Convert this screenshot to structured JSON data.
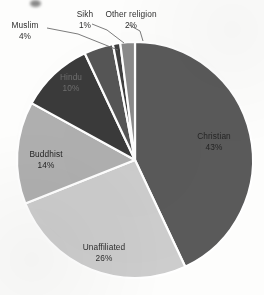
{
  "chart_data": {
    "type": "pie",
    "title": "",
    "categories": [
      "Christian",
      "Unaffiliated",
      "Buddhist",
      "Hindu",
      "Muslim",
      "Sikh",
      "Other religion"
    ],
    "values": [
      43,
      26,
      14,
      10,
      4,
      1,
      2
    ],
    "unit": "%",
    "total": 100,
    "start_angle_deg": 0,
    "direction": "clockwise",
    "legend": "none",
    "labels_position": "mixed-inside-and-outside-with-leader-lines",
    "slices": [
      {
        "label": "Christian",
        "value": 43,
        "value_text": "43%",
        "color": "#5a5a5a",
        "label_placement": "inside",
        "text_color": "#242424"
      },
      {
        "label": "Unaffiliated",
        "value": 26,
        "value_text": "26%",
        "color": "#cdcdcd",
        "label_placement": "outside",
        "text_color": "#2e2e2e"
      },
      {
        "label": "Buddhist",
        "value": 14,
        "value_text": "14%",
        "color": "#b0b0b0",
        "label_placement": "inside",
        "text_color": "#242424"
      },
      {
        "label": "Hindu",
        "value": 10,
        "value_text": "10%",
        "color": "#3a3a3a",
        "label_placement": "inside",
        "text_color": "#6e6e6e"
      },
      {
        "label": "Muslim",
        "value": 4,
        "value_text": "4%",
        "color": "#555555",
        "label_placement": "outside",
        "text_color": "#2e2e2e"
      },
      {
        "label": "Sikh",
        "value": 1,
        "value_text": "1%",
        "color": "#3f3f3f",
        "label_placement": "outside",
        "text_color": "#2e2e2e"
      },
      {
        "label": "Other religion",
        "value": 2,
        "value_text": "2%",
        "color": "#8a8a8a",
        "label_placement": "outside",
        "text_color": "#2e2e2e"
      }
    ],
    "divider_color": "#ffffff",
    "background": "#ffffff"
  },
  "labels": {
    "christian": {
      "name": "Christian",
      "pct": "43%"
    },
    "unaffiliated": {
      "name": "Unaffiliated",
      "pct": "26%"
    },
    "buddhist": {
      "name": "Buddhist",
      "pct": "14%"
    },
    "hindu": {
      "name": "Hindu",
      "pct": "10%"
    },
    "muslim": {
      "name": "Muslim",
      "pct": "4%"
    },
    "sikh": {
      "name": "Sikh",
      "pct": "1%"
    },
    "other": {
      "name": "Other religion",
      "pct": "2%"
    }
  }
}
